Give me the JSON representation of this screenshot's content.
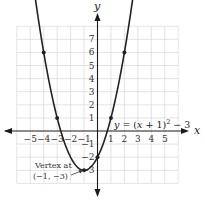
{
  "chart_data": {
    "type": "line",
    "title": "",
    "equation": "y = (x + 1)^2 - 3",
    "equation_label": {
      "y": "y",
      "eq": " = (",
      "x": "x",
      "rest": " + 1)",
      "sup": "2",
      "tail": " − 3"
    },
    "xlabel": "x",
    "ylabel": "y",
    "xlim": [
      -6,
      6
    ],
    "ylim": [
      -4,
      8
    ],
    "grid": true,
    "x_ticks": [
      -5,
      -4,
      -3,
      -2,
      -1,
      1,
      2,
      3,
      4,
      5
    ],
    "x_tick_labels": [
      "−5",
      "−4",
      "−3",
      "−2",
      "−1",
      "1",
      "2",
      "3",
      "4",
      "5"
    ],
    "y_ticks": [
      7,
      6,
      5,
      4,
      3,
      2,
      1,
      -1,
      -2,
      -3
    ],
    "y_tick_labels": [
      "7",
      "6",
      "5",
      "4",
      "3",
      "2",
      "1",
      "−1",
      "−2",
      "−3"
    ],
    "series": [
      {
        "name": "y = (x + 1)^2 - 3",
        "function": "(x+1)^2-3",
        "domain": [
          -4.8,
          2.8
        ],
        "color": "#222222",
        "marked_points": [
          {
            "x": -4,
            "y": 6
          },
          {
            "x": -3,
            "y": 1
          },
          {
            "x": -1,
            "y": -3
          },
          {
            "x": 0,
            "y": -2
          },
          {
            "x": 1,
            "y": 1
          },
          {
            "x": 2,
            "y": 6
          }
        ]
      }
    ],
    "annotations": [
      {
        "text_line1": "Vertex at",
        "text_line2": "(−1, −3)",
        "points_to": {
          "x": -1,
          "y": -3
        }
      }
    ]
  },
  "colors": {
    "grid": "#d8d8d8",
    "axis": "#1a1a1a",
    "curve": "#222222",
    "background": "#ffffff"
  }
}
